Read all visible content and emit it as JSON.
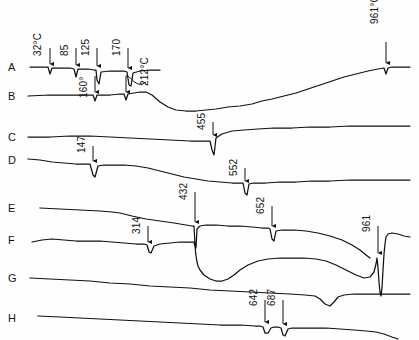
{
  "figure": {
    "title": "",
    "background_color": "#fefefe",
    "line_color": "#111111"
  },
  "chart_data": {
    "type": "line",
    "title": "",
    "xlabel": "",
    "ylabel": "",
    "grid": false,
    "legend_position": "left-axis-labels",
    "axis_note": "Temperature increases left to right; DTA signal vertical. No numeric axes drawn.",
    "curves": [
      {
        "name": "A",
        "label": "A",
        "label_x": 8,
        "label_y": 62,
        "baseline_y": 67,
        "peaks": [
          {
            "value": "32°C",
            "temp": 32,
            "x": 50,
            "depth": 7,
            "width": 5,
            "sharp": true
          },
          {
            "value": "85",
            "temp": 85,
            "x": 76,
            "depth": 9,
            "width": 5,
            "sharp": true
          },
          {
            "value": "125",
            "temp": 125,
            "x": 97,
            "depth": 10,
            "width": 5,
            "sharp": true
          },
          {
            "value": "170",
            "temp": 170,
            "x": 128,
            "depth": 15,
            "width": 7,
            "sharp": true
          }
        ],
        "path": "M 30 67 L 44 67 L 48 67 L 50 74 L 52 68 L 60 68 L 70 68 L 74 69 L 76 77 L 78 69 L 88 69 L 94 70 L 96 70 L 97 80 L 99 84 L 101 72 L 110 71 L 120 71 L 124 71 L 127 72 L 129 85 L 131 86 L 133 73 L 140 71 L 150 70 L 160 70"
      },
      {
        "name": "B",
        "label": "B",
        "label_x": 8,
        "label_y": 91,
        "baseline_y": 96,
        "peaks": [
          {
            "value": "160°",
            "temp": 160,
            "x": 95,
            "depth": 5,
            "width": 4,
            "sharp": true
          },
          {
            "value": "212°C",
            "temp": 212,
            "x": 126,
            "depth": 5,
            "width": 4,
            "sharp": true
          },
          {
            "value": "455",
            "temp": 455,
            "x": 213,
            "depth": 0,
            "width": 0,
            "sharp": false
          }
        ],
        "path": "M 28 96 L 50 95 L 70 95 L 88 95 L 93 95 L 95 101 L 97 95 L 110 95 L 120 94 L 124 94 L 126 100 L 128 94 L 134 93 L 140 92 L 146 92 L 152 95 L 160 102 L 168 107 L 176 110 L 186 111 L 196 111 L 206 110 L 216 109 L 228 107 L 240 106 L 252 104 L 262 101 L 272 99 L 284 96 L 296 93 L 308 89 L 320 85 L 332 81 L 344 77 L 356 74 L 368 71 L 378 69 L 384 68 L 386 74 L 388 68 L 392 67 L 400 67 L 410 67"
      },
      {
        "name": "C",
        "label": "C",
        "label_x": 8,
        "label_y": 132,
        "baseline_y": 137,
        "peaks": [
          {
            "value": "455",
            "temp": 455,
            "x": 213,
            "depth": 18,
            "width": 5,
            "sharp": true
          }
        ],
        "path": "M 28 137 L 50 137 L 70 136 L 90 136 L 110 137 L 130 138 L 150 139 L 170 140 L 190 141 L 205 141 L 210 141 L 212 150 L 214 155 L 216 138 L 222 134 L 232 131 L 244 130 L 258 129 L 274 128 L 292 128 L 310 127 L 330 127 L 350 126 L 370 126 L 390 126 L 410 126"
      },
      {
        "name": "D",
        "label": "D",
        "label_x": 8,
        "label_y": 155,
        "baseline_y": 160,
        "peaks": [
          {
            "value": "147",
            "temp": 147,
            "x": 93,
            "depth": 13,
            "width": 5,
            "sharp": true
          },
          {
            "value": "552",
            "temp": 552,
            "x": 245,
            "depth": 12,
            "width": 4,
            "sharp": true
          }
        ],
        "path": "M 28 159 L 40 160 L 52 162 L 64 163 L 76 164 L 86 164 L 90 164 L 93 175 L 95 177 L 98 166 L 104 165 L 112 165 L 124 165 L 136 166 L 148 168 L 160 171 L 172 174 L 184 177 L 196 179 L 208 181 L 220 182 L 232 183 L 240 183 L 243 183 L 245 193 L 247 195 L 249 184 L 254 183 L 266 183 L 280 182 L 296 182 L 312 181 L 330 181 L 350 180 L 370 180 L 390 180 L 410 180"
      },
      {
        "name": "E",
        "label": "E",
        "label_x": 8,
        "label_y": 203,
        "baseline_y": 208,
        "peaks": [
          {
            "value": "432",
            "temp": 432,
            "x": 195,
            "depth": 30,
            "width": 3,
            "sharp": true
          },
          {
            "value": "652",
            "temp": 652,
            "x": 272,
            "depth": 12,
            "width": 5,
            "sharp": true
          }
        ],
        "path": "M 40 208 L 60 209 L 80 210 L 100 211 L 112 212 L 120 213 L 132 216 L 146 219 L 160 221 L 174 223 L 186 225 L 192 226 L 194 226 L 195 244 L 196 248 L 197 229 L 200 226 L 206 225 L 216 225 L 228 226 L 240 226 L 252 227 L 262 228 L 268 228 L 270 229 L 272 239 L 274 241 L 276 231 L 282 230 L 294 230 L 306 231 L 318 233 L 330 236 L 342 240 L 352 245 L 360 250 L 366 255 L 370 258"
      },
      {
        "name": "F",
        "label": "F",
        "label_x": 8,
        "label_y": 235,
        "baseline_y": 240,
        "peaks": [
          {
            "value": "314",
            "temp": 314,
            "x": 148,
            "depth": 8,
            "width": 5,
            "sharp": true
          },
          {
            "value": "961",
            "temp": 961,
            "x": 378,
            "depth": 38,
            "width": 3,
            "sharp": true
          }
        ],
        "path": "M 32 242 L 42 240 L 52 239 L 64 240 L 76 241 L 88 241 L 100 241 L 112 242 L 124 243 L 136 244 L 144 244 L 147 245 L 149 252 L 151 253 L 154 246 L 160 244 L 170 243 L 180 242 L 190 242 L 194 242 L 195 246 L 196 256 L 197 262 L 198 266 L 200 270 L 204 275 L 210 279 L 216 281 L 222 281 L 228 279 L 234 275 L 240 270 L 248 265 L 258 261 L 268 259 L 280 258 L 292 258 L 304 258 L 316 259 L 326 261 L 336 265 L 346 270 L 356 275 L 364 278 L 370 277 L 374 272 L 376 264 L 377 258 L 378 268 L 379 282 L 380 292 L 381 296 L 382 288 L 383 270 L 384 254 L 385 244 L 386 237 L 388 234 L 392 233 L 398 234 L 404 236 L 410 237"
      },
      {
        "name": "G",
        "label": "G",
        "label_x": 8,
        "label_y": 273,
        "baseline_y": 278,
        "peaks": [
          {
            "value": "",
            "temp": 790,
            "x": 325,
            "depth": 12,
            "width": 10,
            "sharp": false
          }
        ],
        "path": "M 30 278 L 50 279 L 70 280 L 90 281 L 110 283 L 130 284 L 150 286 L 170 287 L 190 288 L 210 290 L 230 291 L 250 292 L 270 293 L 290 294 L 305 295 L 315 296 L 320 299 L 325 304 L 330 306 L 334 302 L 338 297 L 344 295 L 354 294 L 366 294 L 378 294 L 390 294 L 400 294 L 410 294"
      },
      {
        "name": "H",
        "label": "H",
        "label_x": 8,
        "label_y": 313,
        "baseline_y": 318,
        "peaks": [
          {
            "value": "642",
            "temp": 642,
            "x": 265,
            "depth": 7,
            "width": 6,
            "sharp": false
          },
          {
            "value": "687",
            "temp": 687,
            "x": 283,
            "depth": 9,
            "width": 6,
            "sharp": false
          }
        ],
        "path": "M 38 316 L 60 317 L 80 318 L 100 319 L 120 320 L 140 321 L 160 322 L 180 323 L 200 324 L 220 325 L 240 325 L 255 326 L 260 326 L 263 327 L 265 333 L 268 333 L 271 328 L 274 327 L 278 327 L 281 328 L 283 335 L 285 336 L 288 329 L 292 328 L 300 328 L 312 328 L 326 328 L 340 329 L 354 330 L 366 331 L 376 332 L 384 334 L 392 337 L 398 339"
      }
    ],
    "annotations": [
      {
        "text": "32°C",
        "x": 43,
        "y": 46,
        "arrow_x": 50,
        "arrow_top": 48,
        "arrow_bottom": 64,
        "type": "arrow"
      },
      {
        "text": "85",
        "x": 70,
        "y": 46,
        "arrow_x": 76,
        "arrow_top": 48,
        "arrow_bottom": 65,
        "type": "arrow"
      },
      {
        "text": "125",
        "x": 91,
        "y": 46,
        "arrow_x": 97,
        "arrow_top": 48,
        "arrow_bottom": 66,
        "type": "arrow"
      },
      {
        "text": "170",
        "x": 122,
        "y": 46,
        "arrow_x": 128,
        "arrow_top": 48,
        "arrow_bottom": 68,
        "type": "arrow"
      },
      {
        "text": "160°",
        "x": 89,
        "y": 88,
        "arrow_x": 95,
        "arrow_top": 76,
        "arrow_bottom": 92,
        "type": "arrow"
      },
      {
        "text": "212°C",
        "x": 150,
        "y": 76,
        "arrow_x": 126,
        "arrow_top": 76,
        "arrow_bottom": 92,
        "type": "curved"
      },
      {
        "text": "455",
        "x": 207,
        "y": 120,
        "arrow_x": 213,
        "arrow_top": 122,
        "arrow_bottom": 135,
        "type": "arrow"
      },
      {
        "text": "147",
        "x": 87,
        "y": 143,
        "arrow_x": 93,
        "arrow_top": 146,
        "arrow_bottom": 161,
        "type": "arrow"
      },
      {
        "text": "552",
        "x": 239,
        "y": 166,
        "arrow_x": 245,
        "arrow_top": 168,
        "arrow_bottom": 181,
        "type": "arrow"
      },
      {
        "text": "432",
        "x": 189,
        "y": 190,
        "arrow_x": 195,
        "arrow_top": 192,
        "arrow_bottom": 222,
        "type": "arrow"
      },
      {
        "text": "314",
        "x": 142,
        "y": 224,
        "arrow_x": 148,
        "arrow_top": 226,
        "arrow_bottom": 242,
        "type": "arrow"
      },
      {
        "text": "652",
        "x": 266,
        "y": 204,
        "arrow_x": 272,
        "arrow_top": 206,
        "arrow_bottom": 226,
        "type": "arrow"
      },
      {
        "text": "961°C",
        "x": 380,
        "y": 14,
        "arrow_x": 386,
        "arrow_top": 42,
        "arrow_bottom": 63,
        "type": "arrow"
      },
      {
        "text": "961",
        "x": 372,
        "y": 222,
        "arrow_x": 378,
        "arrow_top": 226,
        "arrow_bottom": 253,
        "type": "arrow"
      },
      {
        "text": "642",
        "x": 259,
        "y": 296,
        "arrow_x": 265,
        "arrow_top": 300,
        "arrow_bottom": 322,
        "type": "arrow"
      },
      {
        "text": "687",
        "x": 277,
        "y": 296,
        "arrow_x": 283,
        "arrow_top": 300,
        "arrow_bottom": 324,
        "type": "arrow"
      }
    ]
  }
}
